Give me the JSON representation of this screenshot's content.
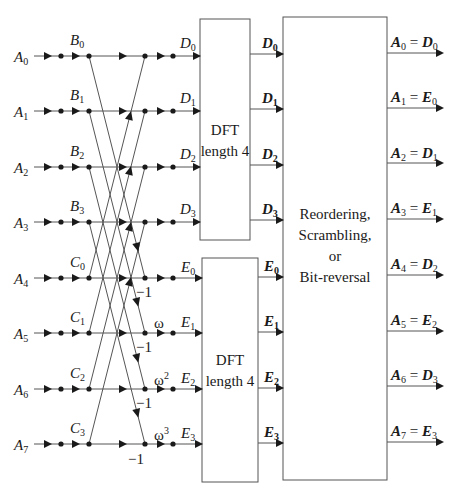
{
  "diagram": {
    "type": "radix-2 decimation-in-frequency FFT flow graph",
    "inputs": [
      {
        "name": "A",
        "index": "0"
      },
      {
        "name": "A",
        "index": "1"
      },
      {
        "name": "A",
        "index": "2"
      },
      {
        "name": "A",
        "index": "3"
      },
      {
        "name": "A",
        "index": "4"
      },
      {
        "name": "A",
        "index": "5"
      },
      {
        "name": "A",
        "index": "6"
      },
      {
        "name": "A",
        "index": "7"
      }
    ],
    "butterfly_inputs": [
      {
        "name": "B",
        "index": "0"
      },
      {
        "name": "B",
        "index": "1"
      },
      {
        "name": "B",
        "index": "2"
      },
      {
        "name": "B",
        "index": "3"
      },
      {
        "name": "C",
        "index": "0"
      },
      {
        "name": "C",
        "index": "1"
      },
      {
        "name": "C",
        "index": "2"
      },
      {
        "name": "C",
        "index": "3"
      }
    ],
    "butterfly_outputs": [
      {
        "name": "D",
        "index": "0"
      },
      {
        "name": "D",
        "index": "1"
      },
      {
        "name": "D",
        "index": "2"
      },
      {
        "name": "D",
        "index": "3"
      },
      {
        "name": "E",
        "index": "0"
      },
      {
        "name": "E",
        "index": "1"
      },
      {
        "name": "E",
        "index": "2"
      },
      {
        "name": "E",
        "index": "3"
      }
    ],
    "twiddles": [
      {
        "row": 5,
        "base": "ω",
        "exp": ""
      },
      {
        "row": 6,
        "base": "ω",
        "exp": "2"
      },
      {
        "row": 7,
        "base": "ω",
        "exp": "3"
      }
    ],
    "minus_one_label": "−1",
    "dft_blocks": [
      {
        "line1": "DFT",
        "line2": "length 4"
      },
      {
        "line1": "DFT",
        "line2": "length 4"
      }
    ],
    "dft_outputs": [
      {
        "name": "D",
        "index": "0"
      },
      {
        "name": "D",
        "index": "1"
      },
      {
        "name": "D",
        "index": "2"
      },
      {
        "name": "D",
        "index": "3"
      },
      {
        "name": "E",
        "index": "0"
      },
      {
        "name": "E",
        "index": "1"
      },
      {
        "name": "E",
        "index": "2"
      },
      {
        "name": "E",
        "index": "3"
      }
    ],
    "reorder_block": {
      "line1": "Reordering,",
      "line2": "Scrambling,",
      "line3": "or",
      "line4": "Bit-reversal"
    },
    "final_outputs": [
      {
        "lhs": "A",
        "lhs_index": "0",
        "eq": "=",
        "rhs": "D",
        "rhs_index": "0"
      },
      {
        "lhs": "A",
        "lhs_index": "1",
        "eq": "=",
        "rhs": "E",
        "rhs_index": "0"
      },
      {
        "lhs": "A",
        "lhs_index": "2",
        "eq": "=",
        "rhs": "D",
        "rhs_index": "1"
      },
      {
        "lhs": "A",
        "lhs_index": "3",
        "eq": "=",
        "rhs": "E",
        "rhs_index": "1"
      },
      {
        "lhs": "A",
        "lhs_index": "4",
        "eq": "=",
        "rhs": "D",
        "rhs_index": "2"
      },
      {
        "lhs": "A",
        "lhs_index": "5",
        "eq": "=",
        "rhs": "E",
        "rhs_index": "2"
      },
      {
        "lhs": "A",
        "lhs_index": "6",
        "eq": "=",
        "rhs": "D",
        "rhs_index": "3"
      },
      {
        "lhs": "A",
        "lhs_index": "7",
        "eq": "=",
        "rhs": "E",
        "rhs_index": "3"
      }
    ]
  }
}
